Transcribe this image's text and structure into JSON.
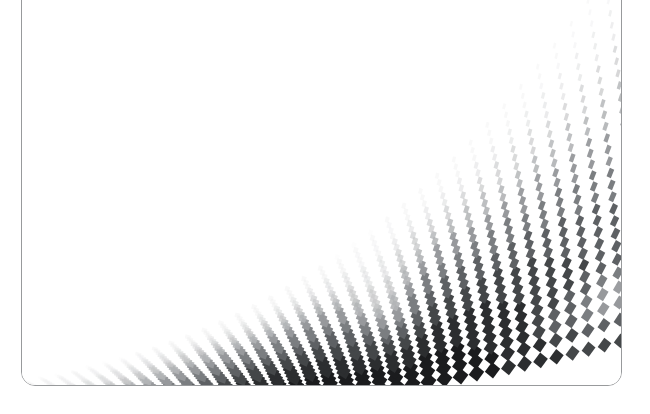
{
  "canvas": {
    "width": 650,
    "height": 414,
    "background_color": "#ffffff"
  },
  "artboard": {
    "name": "abstract-halftone-artwork",
    "border_color": "#989a9c",
    "border_width_px": 1.6,
    "corner_radius_px": 14,
    "fill_color": "#ffffff",
    "x": 21,
    "y": -18,
    "width": 601,
    "height": 404,
    "top_edge_visible": false
  },
  "artwork": {
    "title": "Grayscale diamond halftone wave",
    "description": "A perspective mesh of rotated squares (diamonds) sweeping from the lower-left to the upper-right, curving into a vertical wave crest near the right edge. Tile tone ramps from near-white at the sparse left and top to near-black in the dense lower-centre band.",
    "motif": "diamond-mesh-halftone",
    "gap_color": "#ffffff",
    "tone_ramp": [
      "#fafafa",
      "#ededee",
      "#dedfe0",
      "#c9cacb",
      "#b2b4b6",
      "#97999c",
      "#7b7e81",
      "#5e6164",
      "#444749",
      "#2c2e30",
      "#1b1c1e"
    ],
    "tone_extremes": {
      "lightest": "#fafafa",
      "darkest": "#1b1c1e"
    },
    "grid": {
      "rows": 34,
      "cols": 46,
      "tile_shape": "rotated-square",
      "tile_rotation_deg": 45,
      "perspective": "bottom-heavy, tiles shrink toward top-right"
    },
    "fold_highlight": {
      "present": true,
      "color": "#ffffff",
      "note": "A pale crease sweeps diagonally through the dense field near the right, and a second light band cuts across the lower right."
    }
  },
  "meta": {
    "element_count_visible": 1,
    "has_text": false,
    "text_content": ""
  }
}
